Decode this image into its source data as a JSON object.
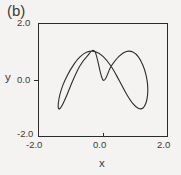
{
  "figure": {
    "panel_label": "(b)",
    "background_color": "#f4f3f1",
    "line_color": "#2b2b2b"
  },
  "chart_data": {
    "type": "line",
    "title": "(b)",
    "xlabel": "x",
    "ylabel": "y",
    "xlim": [
      -2.0,
      2.0
    ],
    "ylim": [
      -2.0,
      2.0
    ],
    "xticks": [
      -2.0,
      0.0,
      2.0
    ],
    "yticks": [
      -2.0,
      0.0,
      2.0
    ],
    "xtick_labels": [
      "-2.0",
      "0.0",
      "2.0"
    ],
    "ytick_labels": [
      "-2.0",
      "0.0",
      "2.0"
    ],
    "grid": false,
    "legend": null,
    "series": [
      {
        "name": "orbit",
        "x": [
          0.0,
          0.249,
          0.491,
          0.717,
          0.921,
          1.094,
          1.231,
          1.325,
          1.373,
          1.373,
          1.325,
          1.231,
          1.094,
          0.921,
          0.717,
          0.491,
          0.249,
          0.0,
          -0.249,
          -0.491,
          -0.717,
          -0.921,
          -1.094,
          -1.231,
          -1.325,
          -1.373,
          -1.373,
          -1.325,
          -1.231,
          -1.094,
          -0.921,
          -0.717,
          -0.491,
          -0.249,
          0.0
        ],
        "y": [
          0.0,
          0.482,
          0.83,
          1.0,
          0.982,
          0.8,
          0.506,
          0.171,
          -0.171,
          -0.506,
          -0.8,
          -0.982,
          -1.0,
          -0.83,
          -0.482,
          0.0,
          0.482,
          0.83,
          1.0,
          0.982,
          0.8,
          0.506,
          0.171,
          -0.171,
          -0.506,
          -0.8,
          -0.982,
          -1.0,
          -0.83,
          -0.482,
          0.0,
          0.482,
          0.83,
          1.0,
          0.982
        ]
      }
    ],
    "tick_labels": {
      "y_top": "2.0",
      "y_mid": "0.0",
      "y_bottom": "-2.0",
      "x_left": "-2.0",
      "x_mid": "0.0",
      "x_right": "2.0"
    },
    "axis_names": {
      "x": "x",
      "y": "y"
    }
  }
}
